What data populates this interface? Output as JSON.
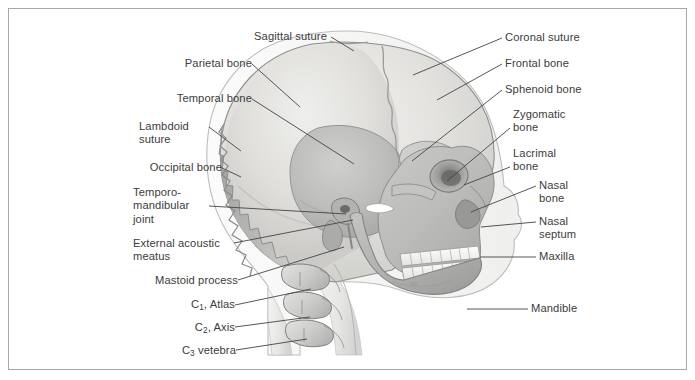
{
  "figure": {
    "border_color": "#a8a8a8",
    "background_color": "#ffffff",
    "text_color": "#3c3c3c",
    "leader_color": "#444444"
  },
  "palette": {
    "scalp_outline": "#b9b9b9",
    "cranium_light": "#e9e9e7",
    "cranium_mid": "#d8d8d6",
    "parietal": "#dedcd9",
    "frontal": "#e4e3e0",
    "occipital": "#b0b0ae",
    "temporal": "#bcbcba",
    "sphenoid": "#c8c8c6",
    "face_mid": "#bdbdbb",
    "mandible": "#b4b4b2",
    "teeth": "#fbfbfa",
    "vertebra": "#d2d2d0",
    "outline_dark": "#555555"
  },
  "labels_left": [
    {
      "id": "parietal-bone",
      "text": "Parietal bone",
      "x": 152,
      "y": 48,
      "align": "right",
      "anchor_x": 243,
      "anchor_y": 55,
      "tip_x": 291,
      "tip_y": 98
    },
    {
      "id": "temporal-bone",
      "text": "Temporal bone",
      "x": 137,
      "y": 83,
      "align": "right",
      "anchor_x": 243,
      "anchor_y": 90,
      "tip_x": 345,
      "tip_y": 155
    },
    {
      "id": "lambdoid-suture",
      "text": "Lambdoid\nsuture",
      "x": 130,
      "y": 111,
      "align": "right",
      "anchor_x": 200,
      "anchor_y": 118,
      "tip_x": 232,
      "tip_y": 142
    },
    {
      "id": "occipital-bone",
      "text": "Occipital bone",
      "x": 129,
      "y": 152,
      "align": "right",
      "anchor_x": 213,
      "anchor_y": 159,
      "tip_x": 232,
      "tip_y": 168
    },
    {
      "id": "temporomandibular-joint",
      "text": "Temporo-\nmandibular\njoint",
      "x": 124,
      "y": 177,
      "align": "right",
      "anchor_x": 200,
      "anchor_y": 197,
      "tip_x": 337,
      "tip_y": 205
    },
    {
      "id": "external-acoustic-meatus",
      "text": "External acoustic\nmeatus",
      "x": 124,
      "y": 228,
      "align": "right",
      "anchor_x": 225,
      "anchor_y": 234,
      "tip_x": 344,
      "tip_y": 211
    },
    {
      "id": "mastoid-process",
      "text": "Mastoid process",
      "x": 131,
      "y": 265,
      "align": "right",
      "anchor_x": 229,
      "anchor_y": 271,
      "tip_x": 335,
      "tip_y": 238
    },
    {
      "id": "c1-atlas",
      "text": "C1, Atlas",
      "x": 178,
      "y": 289,
      "align": "right",
      "anchor_x": 226,
      "anchor_y": 296,
      "tip_x": 302,
      "tip_y": 280
    },
    {
      "id": "c2-axis",
      "text": "C2, Axis",
      "x": 183,
      "y": 312,
      "align": "right",
      "anchor_x": 226,
      "anchor_y": 318,
      "tip_x": 301,
      "tip_y": 308
    },
    {
      "id": "c3-vetebra",
      "text": "C3 vetebra",
      "x": 170,
      "y": 335,
      "align": "right",
      "anchor_x": 227,
      "anchor_y": 341,
      "tip_x": 298,
      "tip_y": 330
    }
  ],
  "labels_top": [
    {
      "id": "sagittal-suture",
      "text": "Sagittal suture",
      "x": 245,
      "y": 21,
      "align": "left",
      "anchor_x": 322,
      "anchor_y": 28,
      "tip_x": 345,
      "tip_y": 42
    }
  ],
  "labels_right": [
    {
      "id": "coronal-suture",
      "text": "Coronal suture",
      "x": 496,
      "y": 22,
      "align": "left",
      "anchor_x": 493,
      "anchor_y": 29,
      "tip_x": 404,
      "tip_y": 66
    },
    {
      "id": "frontal-bone",
      "text": "Frontal bone",
      "x": 496,
      "y": 48,
      "align": "left",
      "anchor_x": 493,
      "anchor_y": 55,
      "tip_x": 428,
      "tip_y": 91
    },
    {
      "id": "sphenoid-bone",
      "text": "Sphenoid bone",
      "x": 496,
      "y": 74,
      "align": "left",
      "anchor_x": 493,
      "anchor_y": 81,
      "tip_x": 403,
      "tip_y": 152
    },
    {
      "id": "zygomatic-bone",
      "text": "Zygomatic\nbone",
      "x": 504,
      "y": 99,
      "align": "left",
      "anchor_x": 501,
      "anchor_y": 119,
      "tip_x": 438,
      "tip_y": 172
    },
    {
      "id": "lacrimal-bone",
      "text": "Lacrimal\nbone",
      "x": 504,
      "y": 138,
      "align": "left",
      "anchor_x": 501,
      "anchor_y": 158,
      "tip_x": 455,
      "tip_y": 176
    },
    {
      "id": "nasal-bone",
      "text": "Nasal\nbone",
      "x": 530,
      "y": 170,
      "align": "left",
      "anchor_x": 527,
      "anchor_y": 177,
      "tip_x": 462,
      "tip_y": 203
    },
    {
      "id": "nasal-septum",
      "text": "Nasal\nseptum",
      "x": 530,
      "y": 206,
      "align": "left",
      "anchor_x": 527,
      "anchor_y": 213,
      "tip_x": 472,
      "tip_y": 218
    },
    {
      "id": "maxilla",
      "text": "Maxilla",
      "x": 530,
      "y": 241,
      "align": "left",
      "anchor_x": 527,
      "anchor_y": 248,
      "tip_x": 471,
      "tip_y": 248
    },
    {
      "id": "mandible",
      "text": "Mandible",
      "x": 522,
      "y": 293,
      "align": "left",
      "anchor_x": 519,
      "anchor_y": 300,
      "tip_x": 458,
      "tip_y": 300
    }
  ]
}
